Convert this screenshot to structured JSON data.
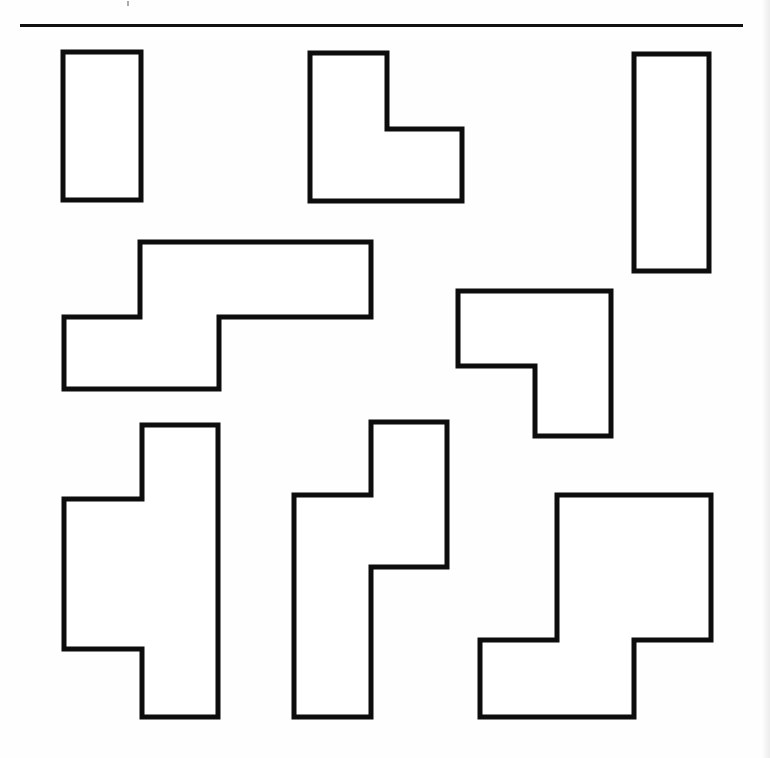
{
  "page": {
    "background_color": "#fefefe",
    "width": 770,
    "height": 758
  },
  "divider": {
    "name": "horizontal-rule",
    "color": "#111111",
    "x": 20,
    "y": 24,
    "width": 723,
    "height": 3
  },
  "shapes": [
    {
      "id": "shape-1",
      "label": "vertical-rectangle-top-left",
      "kind": "rectangle",
      "stroke": "#0d0d0d",
      "fill": "#ffffff",
      "points": "63,52 141,52 141,200 63,200"
    },
    {
      "id": "shape-2",
      "label": "l-shape-top-middle",
      "kind": "L-tetromino",
      "stroke": "#0d0d0d",
      "fill": "#ffffff",
      "points": "310,53 387,53 387,129 462,129 462,201 310,201"
    },
    {
      "id": "shape-3",
      "label": "vertical-rectangle-top-right",
      "kind": "rectangle",
      "stroke": "#0d0d0d",
      "fill": "#ffffff",
      "points": "634,54 709,54 709,271 634,271"
    },
    {
      "id": "shape-4",
      "label": "s-shape-middle-left",
      "kind": "S-tetromino",
      "stroke": "#0d0d0d",
      "fill": "#ffffff",
      "points": "140,242 371,242 371,317 219,317 219,389 64,389 64,317 140,317"
    },
    {
      "id": "shape-5",
      "label": "j-shape-middle-right",
      "kind": "J-tetromino",
      "stroke": "#0d0d0d",
      "fill": "#ffffff",
      "points": "458,291 611,291 611,436 535,436 535,366 458,366"
    },
    {
      "id": "shape-6",
      "label": "s-pentomino-bottom-left",
      "kind": "S-pentomino",
      "stroke": "#0d0d0d",
      "fill": "#ffffff",
      "points": "142,425 218,425 218,717 142,717 142,649 64,649 64,499 142,499"
    },
    {
      "id": "shape-7",
      "label": "n-pentomino-bottom-middle",
      "kind": "N-pentomino",
      "stroke": "#0d0d0d",
      "fill": "#ffffff",
      "points": "371,422 447,422 447,567 371,567 371,717 294,717 294,495 371,495"
    },
    {
      "id": "shape-8",
      "label": "z-pentomino-bottom-right",
      "kind": "Z-pentomino",
      "stroke": "#0d0d0d",
      "fill": "#ffffff",
      "points": "557,495 711,495 711,640 634,640 634,717 480,717 480,640 557,640"
    }
  ],
  "artifacts": {
    "speck_label": "scan-speck"
  }
}
